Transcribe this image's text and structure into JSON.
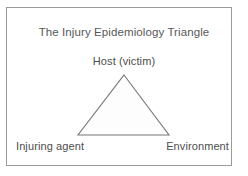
{
  "figure": {
    "title": "The Injury Epidemiology Triangle",
    "frame": {
      "border_color": "#9a9a9a",
      "background_color": "#ffffff"
    },
    "diagram": {
      "type": "triangle",
      "shape_name": "epidemiology-triangle",
      "stroke_color": "#777777",
      "fill_color": "#fdfdfd",
      "vertices": {
        "apex": {
          "x": 124,
          "y": 75
        },
        "bottom_left": {
          "x": 78,
          "y": 135
        },
        "bottom_right": {
          "x": 169,
          "y": 135
        }
      }
    },
    "vertex_labels": {
      "top": "Host (victim)",
      "bottom_left": "Injuring agent",
      "bottom_right": "Environment"
    },
    "text_color": "#4d4d4d",
    "title_color": "#585858"
  }
}
